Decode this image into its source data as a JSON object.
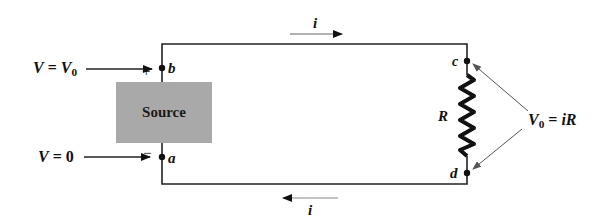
{
  "diagram": {
    "type": "circuit",
    "source": {
      "label": "Source",
      "fill": "#a9a9a9"
    },
    "resistor": {
      "label": "R"
    },
    "nodes": {
      "b": "b",
      "a": "a",
      "c": "c",
      "d": "d"
    },
    "polarity": {
      "plus": "+",
      "minus": "−"
    },
    "left_labels": {
      "top": {
        "var": "V",
        "eq": "=",
        "val": "V",
        "val_sub": "0"
      },
      "bottom": {
        "var": "V",
        "eq": "=",
        "val": "0"
      }
    },
    "right_label": {
      "var": "V",
      "sub": "0",
      "eq": "=",
      "expr": "iR"
    },
    "current": {
      "top": "i",
      "bottom": "i"
    }
  }
}
